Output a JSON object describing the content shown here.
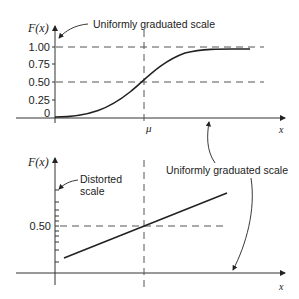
{
  "top_plot": {
    "ylabel": "F(x)",
    "xlabel": "x",
    "mu_label": "μ",
    "annotation": "Uniformly graduated scale",
    "ticks": [
      {
        "label": "1.00",
        "value": 1.0
      },
      {
        "label": "0.75",
        "value": 0.75
      },
      {
        "label": "0.50",
        "value": 0.5
      },
      {
        "label": "0.25",
        "value": 0.25
      },
      {
        "label": "0",
        "value": 0
      }
    ],
    "curve": "S-shaped cumulative distribution, F(μ)=0.50"
  },
  "bottom_plot": {
    "ylabel": "F(x)",
    "xlabel": "x",
    "annotation_left": [
      "Distorted",
      "scale"
    ],
    "annotation_right": "Uniformly graduated scale",
    "ticks": [
      {
        "label": "0.50",
        "value": 0.5
      }
    ],
    "curve": "Straight line on probability paper, crossing 0.50 at μ"
  },
  "colors": {
    "ink": "#222222",
    "dashed": "#555555",
    "background": "#ffffff"
  }
}
